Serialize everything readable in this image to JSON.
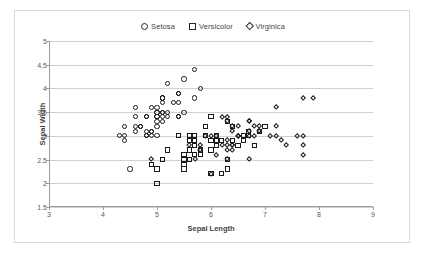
{
  "chart_data": {
    "type": "scatter",
    "title": "",
    "xlabel": "Sepal Length",
    "ylabel": "Sepal Width",
    "xlim": [
      3,
      9
    ],
    "ylim": [
      1.5,
      5
    ],
    "xticks": [
      3,
      4,
      5,
      6,
      7,
      8,
      9
    ],
    "yticks": [
      1.5,
      2,
      2.5,
      3,
      3.5,
      4,
      4.5,
      5
    ],
    "xtick_labels": [
      "3",
      "4",
      "5",
      "6",
      "7",
      "8",
      "9"
    ],
    "ytick_labels": [
      "1.5",
      "2",
      "2.5",
      "3",
      "3.5",
      "4",
      "4.5",
      "5"
    ],
    "grid": "horizontal",
    "legend_position": "top-center",
    "series": [
      {
        "name": "Setosa",
        "marker": "circle",
        "points": [
          [
            5.1,
            3.5
          ],
          [
            4.9,
            3.0
          ],
          [
            4.7,
            3.2
          ],
          [
            4.6,
            3.1
          ],
          [
            5.0,
            3.6
          ],
          [
            5.4,
            3.9
          ],
          [
            4.6,
            3.4
          ],
          [
            5.0,
            3.4
          ],
          [
            4.4,
            2.9
          ],
          [
            4.9,
            3.1
          ],
          [
            5.4,
            3.7
          ],
          [
            4.8,
            3.4
          ],
          [
            4.8,
            3.0
          ],
          [
            4.3,
            3.0
          ],
          [
            5.8,
            4.0
          ],
          [
            5.7,
            4.4
          ],
          [
            5.4,
            3.9
          ],
          [
            5.1,
            3.5
          ],
          [
            5.7,
            3.8
          ],
          [
            5.1,
            3.8
          ],
          [
            5.4,
            3.4
          ],
          [
            5.1,
            3.7
          ],
          [
            4.6,
            3.6
          ],
          [
            5.1,
            3.3
          ],
          [
            4.8,
            3.4
          ],
          [
            5.0,
            3.0
          ],
          [
            5.0,
            3.4
          ],
          [
            5.2,
            3.5
          ],
          [
            5.2,
            3.4
          ],
          [
            4.7,
            3.2
          ],
          [
            4.8,
            3.1
          ],
          [
            5.4,
            3.4
          ],
          [
            5.2,
            4.1
          ],
          [
            5.5,
            4.2
          ],
          [
            4.9,
            3.1
          ],
          [
            5.0,
            3.2
          ],
          [
            5.5,
            3.5
          ],
          [
            4.9,
            3.6
          ],
          [
            4.4,
            3.0
          ],
          [
            5.1,
            3.4
          ],
          [
            5.0,
            3.5
          ],
          [
            4.5,
            2.3
          ],
          [
            4.4,
            3.2
          ],
          [
            5.0,
            3.5
          ],
          [
            5.1,
            3.8
          ],
          [
            4.8,
            3.0
          ],
          [
            5.1,
            3.8
          ],
          [
            4.6,
            3.2
          ],
          [
            5.3,
            3.7
          ],
          [
            5.0,
            3.3
          ]
        ]
      },
      {
        "name": "Versicolor",
        "marker": "square",
        "points": [
          [
            7.0,
            3.2
          ],
          [
            6.4,
            3.2
          ],
          [
            6.9,
            3.1
          ],
          [
            5.5,
            2.3
          ],
          [
            6.5,
            2.8
          ],
          [
            5.7,
            2.8
          ],
          [
            6.3,
            3.3
          ],
          [
            4.9,
            2.4
          ],
          [
            6.6,
            2.9
          ],
          [
            5.2,
            2.7
          ],
          [
            5.0,
            2.0
          ],
          [
            5.9,
            3.0
          ],
          [
            6.0,
            2.2
          ],
          [
            6.1,
            2.9
          ],
          [
            5.6,
            2.9
          ],
          [
            6.7,
            3.1
          ],
          [
            5.6,
            3.0
          ],
          [
            5.8,
            2.7
          ],
          [
            6.2,
            2.2
          ],
          [
            5.6,
            2.5
          ],
          [
            5.9,
            3.2
          ],
          [
            6.1,
            2.8
          ],
          [
            6.3,
            2.5
          ],
          [
            6.1,
            2.8
          ],
          [
            6.4,
            2.9
          ],
          [
            6.6,
            3.0
          ],
          [
            6.8,
            2.8
          ],
          [
            6.7,
            3.0
          ],
          [
            6.0,
            2.9
          ],
          [
            5.7,
            2.6
          ],
          [
            5.5,
            2.4
          ],
          [
            5.5,
            2.4
          ],
          [
            5.8,
            2.7
          ],
          [
            6.0,
            2.7
          ],
          [
            5.4,
            3.0
          ],
          [
            6.0,
            3.4
          ],
          [
            6.7,
            3.1
          ],
          [
            6.3,
            2.3
          ],
          [
            5.6,
            3.0
          ],
          [
            5.5,
            2.5
          ],
          [
            5.5,
            2.6
          ],
          [
            6.1,
            3.0
          ],
          [
            5.8,
            2.6
          ],
          [
            5.0,
            2.3
          ],
          [
            5.6,
            2.7
          ],
          [
            5.7,
            3.0
          ],
          [
            5.7,
            2.9
          ],
          [
            6.2,
            2.9
          ],
          [
            5.1,
            2.5
          ],
          [
            5.7,
            2.8
          ]
        ]
      },
      {
        "name": "Virginica",
        "marker": "diamond",
        "points": [
          [
            6.3,
            3.3
          ],
          [
            5.8,
            2.7
          ],
          [
            7.1,
            3.0
          ],
          [
            6.3,
            2.9
          ],
          [
            6.5,
            3.0
          ],
          [
            7.6,
            3.0
          ],
          [
            4.9,
            2.5
          ],
          [
            7.3,
            2.9
          ],
          [
            6.7,
            2.5
          ],
          [
            7.2,
            3.6
          ],
          [
            6.5,
            3.2
          ],
          [
            6.4,
            2.7
          ],
          [
            6.8,
            3.0
          ],
          [
            5.7,
            2.5
          ],
          [
            5.8,
            2.8
          ],
          [
            6.4,
            3.2
          ],
          [
            6.5,
            3.0
          ],
          [
            7.7,
            3.8
          ],
          [
            7.7,
            2.6
          ],
          [
            6.0,
            2.2
          ],
          [
            6.9,
            3.2
          ],
          [
            5.6,
            2.8
          ],
          [
            7.7,
            2.8
          ],
          [
            6.3,
            2.7
          ],
          [
            6.7,
            3.3
          ],
          [
            7.2,
            3.2
          ],
          [
            6.2,
            2.8
          ],
          [
            6.1,
            3.0
          ],
          [
            6.4,
            2.8
          ],
          [
            7.2,
            3.0
          ],
          [
            7.4,
            2.8
          ],
          [
            7.9,
            3.8
          ],
          [
            6.4,
            2.8
          ],
          [
            6.3,
            2.8
          ],
          [
            6.1,
            2.6
          ],
          [
            7.7,
            3.0
          ],
          [
            6.3,
            3.4
          ],
          [
            6.4,
            3.1
          ],
          [
            6.0,
            3.0
          ],
          [
            6.9,
            3.1
          ],
          [
            6.7,
            3.1
          ],
          [
            6.9,
            3.1
          ],
          [
            5.8,
            2.7
          ],
          [
            6.8,
            3.2
          ],
          [
            6.7,
            3.3
          ],
          [
            6.7,
            3.0
          ],
          [
            6.3,
            2.5
          ],
          [
            6.5,
            3.0
          ],
          [
            6.2,
            3.4
          ],
          [
            5.9,
            3.0
          ]
        ]
      }
    ]
  }
}
